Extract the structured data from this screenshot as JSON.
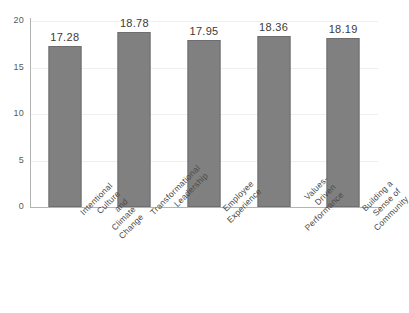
{
  "chart_data": {
    "type": "bar",
    "title": "",
    "subtitle": "",
    "xlabel": "",
    "ylabel": "",
    "categories": [
      "Intentional Culture and\nClimate Change",
      "Transformational\nLeadership",
      "Employee Experience",
      "Values-Driven\nPerformance",
      "Building a Sense of\nCommunity"
    ],
    "values": [
      17.28,
      18.78,
      17.95,
      18.36,
      18.19
    ],
    "value_labels": [
      "17.28",
      "18.78",
      "17.95",
      "18.36",
      "18.19"
    ],
    "ylim": [
      0,
      20
    ],
    "yticks": [
      0,
      5,
      10,
      15,
      20
    ],
    "ytick_labels": [
      "0",
      "5",
      "10",
      "15",
      "20"
    ],
    "grid": true,
    "legend": false,
    "legend_position": "none",
    "bar_color": "#808080",
    "bar_edge_color": "#6e6e6e",
    "gridline_color": "#f0eef0",
    "axis_color": "#b3b3b3",
    "label_color": "#4a4a4a",
    "value_label_color": "#3b3b3b",
    "background_color": "#ffffff",
    "xtick_rotation": -45
  }
}
